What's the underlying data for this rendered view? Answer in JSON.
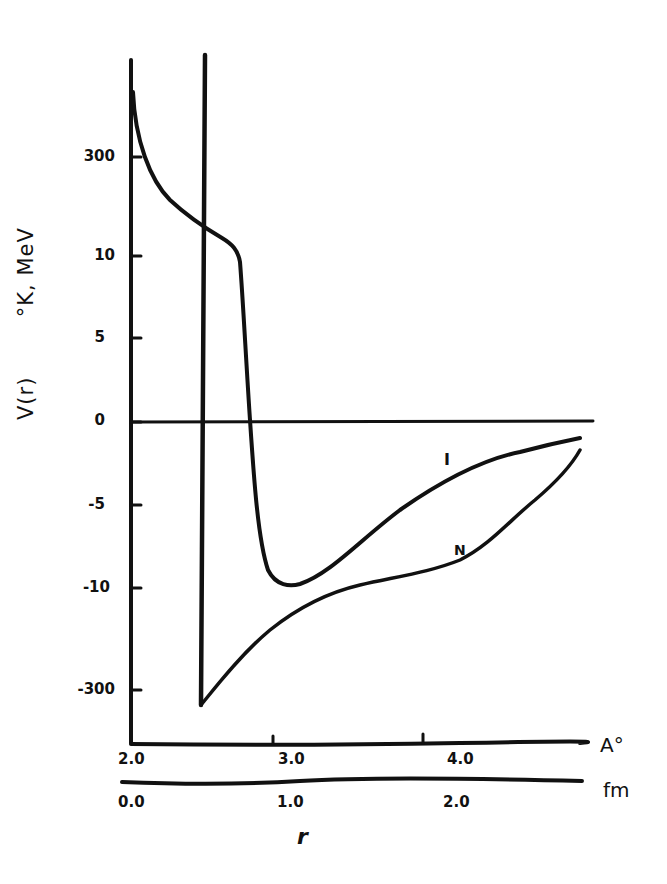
{
  "chart_data": {
    "type": "line",
    "title": "",
    "xlabel": "r",
    "ylabel": "V(r)",
    "ylabel_units": "°K, MeV",
    "x_axes": [
      {
        "unit": "A°",
        "ticks": [
          {
            "label": "2.0",
            "value": 2.0
          },
          {
            "label": "3.0",
            "value": 3.0
          },
          {
            "label": "4.0",
            "value": 4.0
          }
        ]
      },
      {
        "unit": "fm",
        "ticks": [
          {
            "label": "0.0",
            "value": 0.0
          },
          {
            "label": "1.0",
            "value": 1.0
          },
          {
            "label": "2.0",
            "value": 2.0
          }
        ]
      }
    ],
    "y_ticks": [
      "300",
      "10",
      "5",
      "0",
      "-5",
      "-10",
      "-300"
    ],
    "y_scale_note": "broken scale: outer ticks 300 / -300 (°K), inner ticks 10..-10 (MeV)",
    "grid": false,
    "vertical_reference_line_x_angstrom": 2.43,
    "series": [
      {
        "name": "I",
        "x_angstrom": [
          2.03,
          2.1,
          2.2,
          2.3,
          2.43,
          2.55,
          2.65,
          2.68,
          2.7,
          2.72,
          2.75,
          2.8,
          2.9,
          3.0,
          3.2,
          3.4,
          3.6,
          3.8,
          4.0,
          4.2,
          4.4,
          4.65
        ],
        "y": [
          300,
          140,
          40,
          14,
          11,
          10.3,
          9.5,
          7,
          3,
          0,
          -3.5,
          -8,
          -9.9,
          -9.8,
          -8.5,
          -6.7,
          -4.8,
          -3.4,
          -2.4,
          -1.7,
          -1.3,
          -1.1
        ]
      },
      {
        "name": "N",
        "x_angstrom": [
          2.43,
          2.6,
          2.8,
          3.0,
          3.2,
          3.4,
          3.6,
          3.8,
          4.0,
          4.2,
          4.4,
          4.65
        ],
        "y": [
          -300,
          -14,
          -11.9,
          -10.8,
          -10.2,
          -9.9,
          -9.5,
          -9.0,
          -8.2,
          -6.5,
          -4.5,
          -1.8
        ]
      }
    ]
  },
  "labels": {
    "y_axis_title": "V(r)",
    "y_axis_units": "°K,  MeV",
    "x_axis_title": "r",
    "unit_angstrom": "A°",
    "unit_fm": "fm",
    "curve_I": "I",
    "curve_N": "N"
  }
}
